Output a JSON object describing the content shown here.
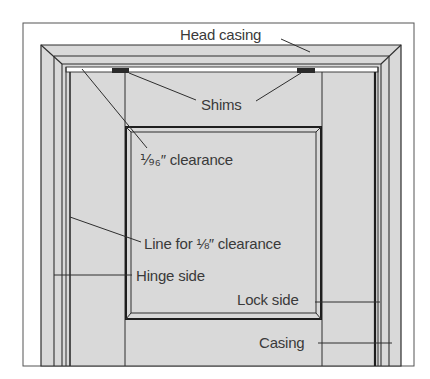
{
  "diagram": {
    "type": "door-frame-installation",
    "colors": {
      "background": "#ffffff",
      "fill": "#d9d9d9",
      "line": "#2e2e2e",
      "shim": "#2a2a2a",
      "text": "#3a3a3a"
    },
    "labels": {
      "head_casing": "Head casing",
      "shims": "Shims",
      "clearance_sixteenth": "⅑₆″ clearance",
      "line_eighth": "Line for ⅛″ clearance",
      "hinge_side": "Hinge side",
      "lock_side": "Lock side",
      "casing": "Casing"
    }
  }
}
